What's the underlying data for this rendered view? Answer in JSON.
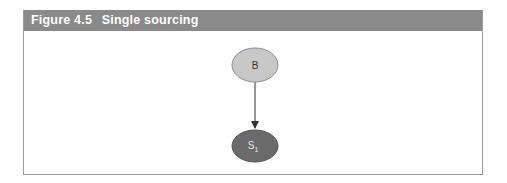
{
  "figure": {
    "label": "Figure 4.5",
    "title": "Single sourcing"
  },
  "diagram": {
    "nodes": [
      {
        "id": "B",
        "label": "B",
        "subscript": "",
        "fill": "#c8c8c8",
        "text_color": "#333333"
      },
      {
        "id": "S1",
        "label": "S",
        "subscript": "1",
        "fill": "#6b6b6b",
        "text_color": "#e8e8e8"
      }
    ],
    "edges": [
      {
        "from": "B",
        "to": "S1",
        "directed": true
      }
    ],
    "colors": {
      "header_bg": "#8a8a8a",
      "border": "#9a9a9a",
      "edge": "#333333"
    }
  }
}
